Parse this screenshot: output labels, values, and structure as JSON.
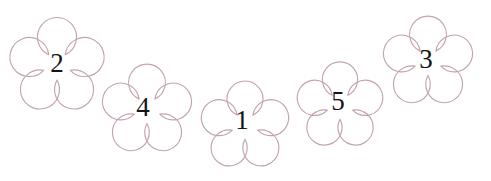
{
  "canvas": {
    "width": 491,
    "height": 181,
    "background_color": "#ffffff"
  },
  "style": {
    "petal_stroke_color": "#c2a3b4",
    "petal_fill_color": "#ffffff",
    "label_color": "#141414",
    "stroke_width": 1.15
  },
  "diagram": {
    "type": "flower-number-arrangement",
    "shape_count": 5,
    "petals_per_flower": 5,
    "arrangement": "downward-arc"
  },
  "flowers": [
    {
      "id": "flower-2",
      "label": "2",
      "center_x": 57,
      "center_y": 66,
      "radius": 52,
      "petal_radius": 19.5,
      "petal_offset": 29,
      "rotation": 0,
      "label_x": 57,
      "label_y": 66
    },
    {
      "id": "flower-4",
      "label": "4",
      "center_x": 147,
      "center_y": 110,
      "radius": 49,
      "petal_radius": 18.4,
      "petal_offset": 27.5,
      "rotation": 0,
      "label_x": 143,
      "label_y": 110
    },
    {
      "id": "flower-1",
      "label": "1",
      "center_x": 245,
      "center_y": 126,
      "radius": 48,
      "petal_radius": 18.0,
      "petal_offset": 27,
      "rotation": 0,
      "label_x": 242,
      "label_y": 123
    },
    {
      "id": "flower-5",
      "label": "5",
      "center_x": 340,
      "center_y": 106,
      "radius": 47,
      "petal_radius": 17.6,
      "petal_offset": 26.5,
      "rotation": 0,
      "label_x": 338,
      "label_y": 104
    },
    {
      "id": "flower-3",
      "label": "3",
      "center_x": 428,
      "center_y": 62,
      "radius": 49,
      "petal_radius": 18.4,
      "petal_offset": 27.5,
      "rotation": 0,
      "label_x": 426,
      "label_y": 62
    }
  ]
}
